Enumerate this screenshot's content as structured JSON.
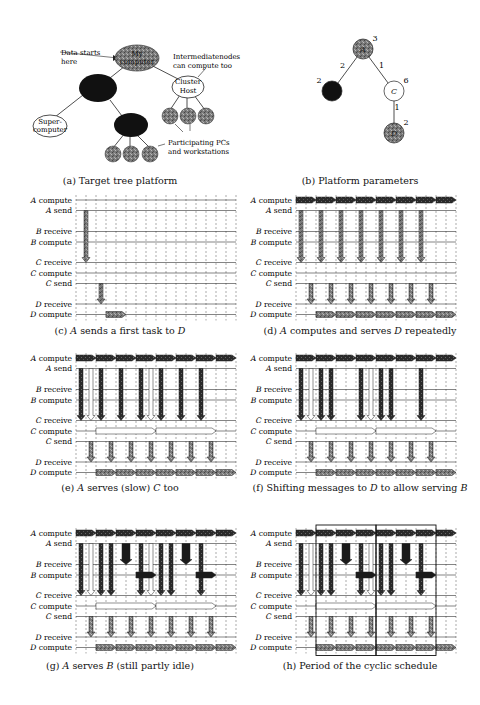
{
  "panels": {
    "a": {
      "caption": "(a) Target tree platform",
      "labels": {
        "data_starts": [
          "Data starts",
          "here"
        ],
        "my_computer": [
          "My",
          "computer"
        ],
        "intermediate": [
          "Intermediatenodes",
          "can compute too"
        ],
        "cluster_host": [
          "Cluster",
          "Host"
        ],
        "supercomputer": [
          "Super-",
          "computer"
        ],
        "participating": [
          "Participating PCs",
          "and workstations"
        ]
      }
    },
    "b": {
      "caption": "(b) Platform parameters",
      "nodes": [
        {
          "id": "A",
          "x": 363,
          "y": 49,
          "weight": "3",
          "fill": "#777"
        },
        {
          "id": "B",
          "x": 332,
          "y": 91,
          "weight": "2",
          "fill": "#111"
        },
        {
          "id": "C",
          "x": 394,
          "y": 91,
          "weight": "6",
          "fill": "#fff"
        },
        {
          "id": "D",
          "x": 394,
          "y": 133,
          "weight": "2",
          "fill": "#777"
        }
      ],
      "edges": [
        {
          "from": "A",
          "to": "B",
          "cost": "2"
        },
        {
          "from": "A",
          "to": "C",
          "cost": "1"
        },
        {
          "from": "C",
          "to": "D",
          "cost": "1"
        }
      ]
    },
    "timelines": [
      {
        "id": "c",
        "caption": "(c) A sends a first task to D",
        "caption_parts": [
          "(c) ",
          "A",
          " sends a first task to ",
          "D",
          ""
        ]
      },
      {
        "id": "d",
        "caption": "(d) A computes and serves D repeatedly",
        "caption_parts": [
          "(d) ",
          "A",
          " computes and serves ",
          "D",
          " repeatedly"
        ]
      },
      {
        "id": "e",
        "caption": "(e) A serves (slow) C too",
        "caption_parts": [
          "(e) ",
          "A",
          " serves (slow) ",
          "C",
          " too"
        ]
      },
      {
        "id": "f",
        "caption": "(f) Shifting messages to D to allow serving B",
        "caption_parts": [
          "(f) Shifting messages to ",
          "D",
          " to allow serving ",
          "B",
          ""
        ]
      },
      {
        "id": "g",
        "caption": "(g) A serves B (still partly idle)",
        "caption_parts": [
          "(g) ",
          "A",
          " serves ",
          "B",
          " (still partly idle)"
        ]
      },
      {
        "id": "h",
        "caption": "(h) Period of the cyclic schedule",
        "caption_parts": [
          "(h) Period of the cyclic schedule",
          "",
          "",
          "",
          ""
        ]
      }
    ]
  },
  "row_labels": [
    {
      "proc": "A",
      "text": " compute"
    },
    {
      "proc": "A",
      "text": " send"
    },
    {
      "proc": "B",
      "text": " receive"
    },
    {
      "proc": "B",
      "text": " compute"
    },
    {
      "proc": "C",
      "text": " receive"
    },
    {
      "proc": "C",
      "text": " compute"
    },
    {
      "proc": "C",
      "text": " send"
    },
    {
      "proc": "D",
      "text": " receive"
    },
    {
      "proc": "D",
      "text": " compute"
    }
  ],
  "colors": {
    "ink": "#111111",
    "dark_node": "#1a1a1a",
    "gray_node": "#7a7a7a",
    "gray_arrow": "#8a8a8a",
    "dark_arrow": "#2a2a2a",
    "white": "#ffffff",
    "grid": "#555555"
  },
  "schedule": {
    "time_units": 16,
    "a_compute_period": 2,
    "a_to_c_cost": 1,
    "a_to_b_cost": 2,
    "c_to_d_cost": 1,
    "c_compute": 6,
    "d_compute": 2,
    "b_compute": 2,
    "cyclic_period": 6
  }
}
